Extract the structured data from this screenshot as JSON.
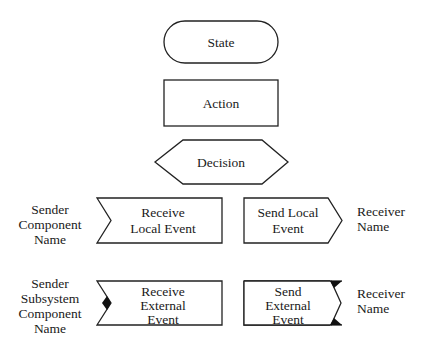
{
  "diagram": {
    "title": "",
    "colors": {
      "stroke": "#222222",
      "fill": "#ffffff",
      "text": "#1a1a1a",
      "marker": "#111111"
    },
    "shapes": {
      "state": {
        "label": "State",
        "type": "rounded-pill"
      },
      "action": {
        "label": "Action",
        "type": "rectangle"
      },
      "decision": {
        "label": "Decision",
        "type": "hexagon"
      },
      "receive_local": {
        "type": "notched-rectangle",
        "lines": [
          "Receive",
          "Local Event"
        ]
      },
      "send_local": {
        "type": "pointed-rectangle",
        "lines": [
          "Send Local",
          "Event"
        ]
      },
      "receive_external": {
        "type": "notched-rectangle-with-marker",
        "lines": [
          "Receive",
          "External",
          "Event"
        ]
      },
      "send_external": {
        "type": "pointed-rectangle-with-markers",
        "lines": [
          "Send",
          "External",
          "Event"
        ]
      }
    },
    "annotations": {
      "sender_local": [
        "Sender",
        "Component",
        "Name"
      ],
      "receiver_local": [
        "Receiver",
        "Name"
      ],
      "sender_external": [
        "Sender",
        "Subsystem",
        "Component",
        "Name"
      ],
      "receiver_external": [
        "Receiver",
        "Name"
      ]
    }
  }
}
